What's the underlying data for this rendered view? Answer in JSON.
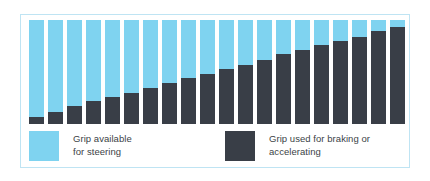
{
  "chart_data": {
    "type": "bar",
    "title": "",
    "subtitle": "",
    "xlabel": "",
    "ylabel": "",
    "stacked": true,
    "normalized": true,
    "grid": false,
    "axis_visible": false,
    "tick_labels_visible": false,
    "ylim": [
      0,
      100
    ],
    "legend_position": "bottom",
    "categories": [
      "1",
      "2",
      "3",
      "4",
      "5",
      "6",
      "7",
      "8",
      "9",
      "10",
      "11",
      "12",
      "13",
      "14",
      "15",
      "16",
      "17",
      "18",
      "19",
      "20"
    ],
    "series": [
      {
        "name": "Grip available for steering",
        "color": "#7fd3f0",
        "values": [
          93,
          88,
          83,
          78,
          74,
          70,
          65,
          61,
          56,
          52,
          47,
          43,
          38,
          33,
          29,
          24,
          20,
          16,
          11,
          7
        ]
      },
      {
        "name": "Grip used for braking or accelerating",
        "color": "#393e47",
        "values": [
          7,
          12,
          17,
          22,
          26,
          30,
          35,
          39,
          44,
          48,
          53,
          57,
          62,
          67,
          71,
          76,
          80,
          84,
          89,
          93
        ]
      }
    ],
    "annotations": []
  },
  "legend": {
    "entries": [
      {
        "name": "legend-available",
        "label": "Grip available\nfor steering",
        "color": "#7fd3f0"
      },
      {
        "name": "legend-used",
        "label": "Grip used for braking or\naccelerating",
        "color": "#393e47"
      }
    ]
  },
  "style": {
    "panel_border_color": "#bfe4f3",
    "panel_background": "#ffffff",
    "page_background": "#ffffff",
    "text_color": "#3b3f46"
  }
}
